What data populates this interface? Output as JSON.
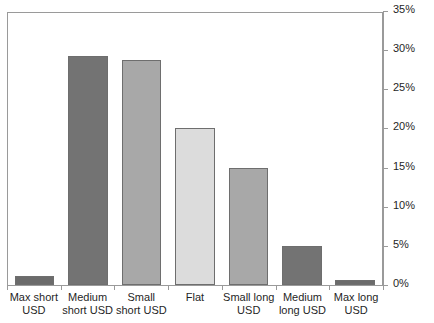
{
  "chart_data": {
    "type": "bar",
    "title": "",
    "title_fragment": "",
    "xlabel": "",
    "ylabel": "",
    "ylim": [
      0,
      35
    ],
    "ytick_values": [
      0,
      5,
      10,
      15,
      20,
      25,
      30,
      35
    ],
    "ytick_labels": [
      "0%",
      "5%",
      "10%",
      "15%",
      "20%",
      "25%",
      "30%",
      "35%"
    ],
    "grid": false,
    "legend": "none",
    "categories": [
      "Max short USD",
      "Medium short USD",
      "Small short USD",
      "Flat",
      "Small long USD",
      "Medium long USD",
      "Max long USD"
    ],
    "values": [
      1.2,
      29.2,
      28.7,
      20.0,
      15.0,
      5.0,
      0.6
    ],
    "value_labels": [
      "1.2%",
      "29.2%",
      "28.7%",
      "20.0%",
      "15.0%",
      "5.0%",
      "0.6%"
    ],
    "bar_colors": [
      "#6b6b6b",
      "#737373",
      "#a8a8a8",
      "#dcdcdc",
      "#a8a8a8",
      "#737373",
      "#6b6b6b"
    ],
    "bar_border_color": "#6e6e6e",
    "axis_color": "#9a9a9a",
    "background_color": "#ffffff",
    "text_color": "#1f1f1f"
  },
  "axis": {
    "y_position": "right",
    "x_position": "bottom"
  }
}
